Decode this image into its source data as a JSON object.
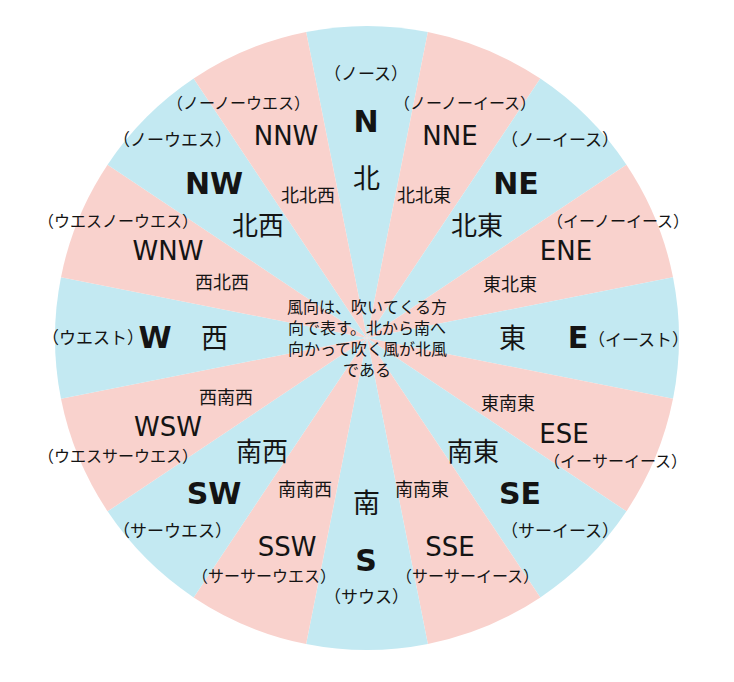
{
  "figure": {
    "center_note": "風向は、吹いてくる方向で表す。北から南へ向かって吹く風が北風である",
    "colors": {
      "cardinal_wedge": "#c3e9f2",
      "secondary_wedge": "#f9d2cd",
      "background": "#ffffff",
      "text": "#141414"
    }
  },
  "directions": [
    {
      "abbr": "N",
      "kanji": "北",
      "kana": "（ノース）",
      "bearing": 0,
      "tier": "cardinal"
    },
    {
      "abbr": "NNE",
      "kanji": "北北東",
      "kana": "（ノーノーイース）",
      "bearing": 22.5,
      "tier": "secondary"
    },
    {
      "abbr": "NE",
      "kanji": "北東",
      "kana": "（ノーイース）",
      "bearing": 45,
      "tier": "cardinal"
    },
    {
      "abbr": "ENE",
      "kanji": "東北東",
      "kana": "（イーノーイース）",
      "bearing": 67.5,
      "tier": "secondary"
    },
    {
      "abbr": "E",
      "kanji": "東",
      "kana": "（イースト）",
      "bearing": 90,
      "tier": "cardinal"
    },
    {
      "abbr": "ESE",
      "kanji": "東南東",
      "kana": "（イーサーイース）",
      "bearing": 112.5,
      "tier": "secondary"
    },
    {
      "abbr": "SE",
      "kanji": "南東",
      "kana": "（サーイース）",
      "bearing": 135,
      "tier": "cardinal"
    },
    {
      "abbr": "SSE",
      "kanji": "南南東",
      "kana": "（サーサーイース）",
      "bearing": 157.5,
      "tier": "secondary"
    },
    {
      "abbr": "S",
      "kanji": "南",
      "kana": "（サウス）",
      "bearing": 180,
      "tier": "cardinal"
    },
    {
      "abbr": "SSW",
      "kanji": "南南西",
      "kana": "（サーサーウエス）",
      "bearing": 202.5,
      "tier": "secondary"
    },
    {
      "abbr": "SW",
      "kanji": "南西",
      "kana": "（サーウエス）",
      "bearing": 225,
      "tier": "cardinal"
    },
    {
      "abbr": "WSW",
      "kanji": "西南西",
      "kana": "（ウエスサーウエス）",
      "bearing": 247.5,
      "tier": "secondary"
    },
    {
      "abbr": "W",
      "kanji": "西",
      "kana": "（ウエスト）",
      "bearing": 270,
      "tier": "cardinal"
    },
    {
      "abbr": "WNW",
      "kanji": "西北西",
      "kana": "（ウエスノーウエス）",
      "bearing": 292.5,
      "tier": "secondary"
    },
    {
      "abbr": "NW",
      "kanji": "北西",
      "kana": "（ノーウエス）",
      "bearing": 315,
      "tier": "cardinal"
    },
    {
      "abbr": "NNW",
      "kanji": "北北西",
      "kana": "（ノーノーウエス）",
      "bearing": 337.5,
      "tier": "secondary"
    }
  ],
  "label_positions": {
    "N": {
      "abbr": [
        366,
        122
      ],
      "kanji": [
        366,
        178
      ],
      "kana": [
        366,
        74
      ]
    },
    "NNE": {
      "abbr": [
        450,
        136
      ],
      "kanji": [
        424,
        196
      ],
      "kana": [
        465,
        104
      ]
    },
    "NE": {
      "abbr": [
        516,
        184
      ],
      "kanji": [
        477,
        226
      ],
      "kana": [
        560,
        140
      ]
    },
    "ENE": {
      "abbr": [
        566,
        251
      ],
      "kanji": [
        510,
        285
      ],
      "kana": [
        618,
        222
      ]
    },
    "E": {
      "abbr": [
        578,
        338
      ],
      "kanji": [
        512,
        338
      ],
      "kana": [
        638,
        340
      ]
    },
    "ESE": {
      "abbr": [
        564,
        434
      ],
      "kanji": [
        508,
        404
      ],
      "kana": [
        615,
        462
      ]
    },
    "SE": {
      "abbr": [
        520,
        494
      ],
      "kanji": [
        473,
        452
      ],
      "kana": [
        560,
        531
      ]
    },
    "SSE": {
      "abbr": [
        450,
        547
      ],
      "kanji": [
        422,
        490
      ],
      "kana": [
        467,
        577
      ]
    },
    "S": {
      "abbr": [
        366,
        561
      ],
      "kanji": [
        366,
        503
      ],
      "kana": [
        366,
        597
      ]
    },
    "SSW": {
      "abbr": [
        287,
        547
      ],
      "kanji": [
        305,
        490
      ],
      "kana": [
        264,
        577
      ]
    },
    "SW": {
      "abbr": [
        214,
        494
      ],
      "kanji": [
        262,
        452
      ],
      "kana": [
        172,
        531
      ]
    },
    "WSW": {
      "abbr": [
        168,
        427
      ],
      "kanji": [
        226,
        398
      ],
      "kana": [
        118,
        457
      ]
    },
    "W": {
      "abbr": [
        155,
        338
      ],
      "kanji": [
        214,
        338
      ],
      "kana": [
        93,
        338
      ]
    },
    "WNW": {
      "abbr": [
        168,
        251
      ],
      "kanji": [
        222,
        283
      ],
      "kana": [
        118,
        222
      ]
    },
    "NW": {
      "abbr": [
        214,
        184
      ],
      "kanji": [
        258,
        226
      ],
      "kana": [
        172,
        140
      ]
    },
    "NNW": {
      "abbr": [
        286,
        136
      ],
      "kanji": [
        308,
        196
      ],
      "kana": [
        238,
        104
      ]
    }
  },
  "geometry": {
    "center_x": 367,
    "center_y": 338,
    "radius": 312
  }
}
